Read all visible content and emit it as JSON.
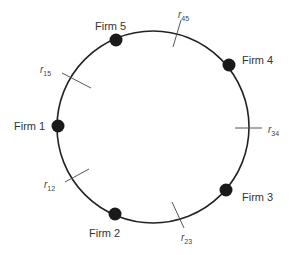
{
  "diagram": {
    "title": "",
    "type": "circular-city",
    "circle": {
      "cx": 153,
      "cy": 127,
      "r": 96,
      "stroke": "#222222"
    },
    "firms": [
      {
        "id": "firm1",
        "label": "Firm 1",
        "x": 58,
        "y": 126,
        "label_x": 14,
        "label_y": 130,
        "anchor": "start"
      },
      {
        "id": "firm2",
        "label": "Firm 2",
        "x": 115,
        "y": 214,
        "label_x": 89,
        "label_y": 237,
        "anchor": "start"
      },
      {
        "id": "firm3",
        "label": "Firm 3",
        "x": 226,
        "y": 190,
        "label_x": 242,
        "label_y": 201,
        "anchor": "start"
      },
      {
        "id": "firm4",
        "label": "Firm 4",
        "x": 229,
        "y": 65,
        "label_x": 242,
        "label_y": 64,
        "anchor": "start"
      },
      {
        "id": "firm5",
        "label": "Firm 5",
        "x": 116,
        "y": 40,
        "label_x": 95,
        "label_y": 30,
        "anchor": "start"
      }
    ],
    "boundaries": [
      {
        "id": "r15",
        "base": "r",
        "sub": "15",
        "x1": 62,
        "y1": 73,
        "x2": 91,
        "y2": 88,
        "label_x": 40,
        "label_y": 73
      },
      {
        "id": "r45",
        "base": "r",
        "sub": "45",
        "x1": 181,
        "y1": 20,
        "x2": 173,
        "y2": 47,
        "label_x": 178,
        "label_y": 18
      },
      {
        "id": "r34",
        "base": "r",
        "sub": "34",
        "x1": 235,
        "y1": 128,
        "x2": 262,
        "y2": 128,
        "label_x": 268,
        "label_y": 133
      },
      {
        "id": "r23",
        "base": "r",
        "sub": "23",
        "x1": 172,
        "y1": 202,
        "x2": 184,
        "y2": 228,
        "label_x": 181,
        "label_y": 241
      },
      {
        "id": "r12",
        "base": "r",
        "sub": "12",
        "x1": 65,
        "y1": 182,
        "x2": 89,
        "y2": 169,
        "label_x": 44,
        "label_y": 188
      }
    ],
    "colors": {
      "firm_dot": "#1a1a1a",
      "tick": "#555555",
      "text": "#333333"
    }
  }
}
